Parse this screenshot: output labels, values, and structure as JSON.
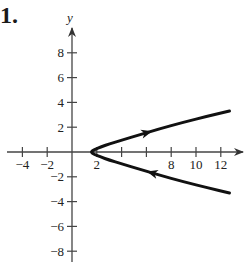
{
  "problem": {
    "number": "1."
  },
  "chart_data": {
    "type": "line",
    "title": "",
    "xlabel": "",
    "ylabel": "y",
    "xlim": [
      -5,
      14
    ],
    "ylim": [
      -9,
      10
    ],
    "grid": false,
    "x_ticks": [
      -4,
      -2,
      2,
      4,
      6,
      8,
      10,
      12
    ],
    "x_tick_labels": [
      "−4",
      "−2",
      "2",
      "",
      "",
      "8",
      "10",
      "12"
    ],
    "y_ticks": [
      8,
      6,
      4,
      2,
      -2,
      -4,
      -6,
      -8
    ],
    "y_tick_labels": [
      "8",
      "6",
      "4",
      "2",
      "−2",
      "−4",
      "−6",
      "−8"
    ],
    "series": [
      {
        "name": "parametric curve (orientation arrows)",
        "points": [
          [
            12.7,
            -3.3
          ],
          [
            11.0,
            -2.9
          ],
          [
            9.0,
            -2.4
          ],
          [
            7.0,
            -1.85
          ],
          [
            5.5,
            -1.4
          ],
          [
            4.0,
            -0.95
          ],
          [
            3.0,
            -0.65
          ],
          [
            2.3,
            -0.4
          ],
          [
            1.8,
            -0.2
          ],
          [
            1.5,
            0.0
          ],
          [
            1.8,
            0.2
          ],
          [
            2.3,
            0.4
          ],
          [
            3.0,
            0.65
          ],
          [
            4.0,
            0.95
          ],
          [
            5.5,
            1.4
          ],
          [
            7.0,
            1.85
          ],
          [
            9.0,
            2.4
          ],
          [
            11.0,
            2.9
          ],
          [
            12.7,
            3.3
          ]
        ],
        "orientation": "from lower-right branch toward vertex, then out along upper branch",
        "arrows": [
          {
            "at": [
              6.0,
              1.55
            ],
            "direction": "right-up"
          },
          {
            "at": [
              6.5,
              -1.7
            ],
            "direction": "left-up"
          }
        ],
        "color": "#111111"
      }
    ]
  }
}
